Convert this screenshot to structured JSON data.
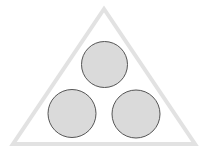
{
  "diagram": {
    "background": "#ffffff",
    "triangle": {
      "points": [
        [
          104,
          9
        ],
        [
          13,
          144
        ],
        [
          195,
          144
        ]
      ],
      "stroke": "#e2e2e2",
      "stroke_width": 4,
      "fill": "#ffffff"
    },
    "circles": [
      {
        "id": "top",
        "cx": 104.5,
        "cy": 64.5,
        "r": 23,
        "fill": "#dadada",
        "stroke": "#555555"
      },
      {
        "id": "bottom-left",
        "cx": 72,
        "cy": 113.5,
        "r": 24,
        "fill": "#dadada",
        "stroke": "#555555"
      },
      {
        "id": "bottom-right",
        "cx": 136,
        "cy": 114,
        "r": 24,
        "fill": "#dadada",
        "stroke": "#555555"
      }
    ]
  }
}
